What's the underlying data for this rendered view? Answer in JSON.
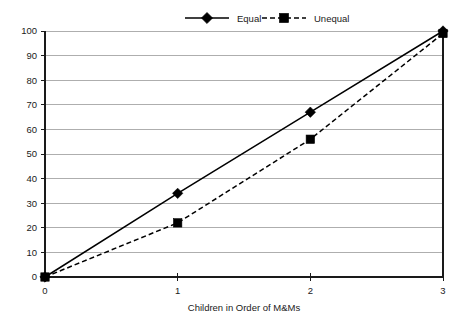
{
  "chart_data": {
    "type": "line",
    "title": "",
    "xlabel": "Children in Order of M&Ms",
    "ylabel": "",
    "x": [
      0,
      1,
      2,
      3
    ],
    "xtick_labels": [
      "0",
      "1",
      "2",
      "3"
    ],
    "ytick_labels": [
      "0",
      "10",
      "20",
      "30",
      "40",
      "50",
      "60",
      "70",
      "80",
      "90",
      "100"
    ],
    "ytick_values": [
      0,
      10,
      20,
      30,
      40,
      50,
      60,
      70,
      80,
      90,
      100
    ],
    "xlim": [
      0,
      3
    ],
    "ylim": [
      0,
      100
    ],
    "grid": "horizontal",
    "legend_position": "top-center",
    "series": [
      {
        "name": "Equal",
        "values": [
          0,
          34,
          67,
          100
        ],
        "line_style": "solid",
        "marker": "diamond",
        "color": "#000000"
      },
      {
        "name": "Unequal",
        "values": [
          0,
          22,
          56,
          99
        ],
        "line_style": "dashed",
        "marker": "square",
        "color": "#000000"
      }
    ]
  },
  "legend": {
    "items": [
      {
        "label": "Equal",
        "marker": "diamond-marker-icon",
        "line_style": "solid"
      },
      {
        "label": "Unequal",
        "marker": "square-marker-icon",
        "line_style": "dashed"
      }
    ]
  },
  "colors": {
    "ink": "#000000",
    "grid": "#9a9a9a",
    "background": "#ffffff"
  }
}
